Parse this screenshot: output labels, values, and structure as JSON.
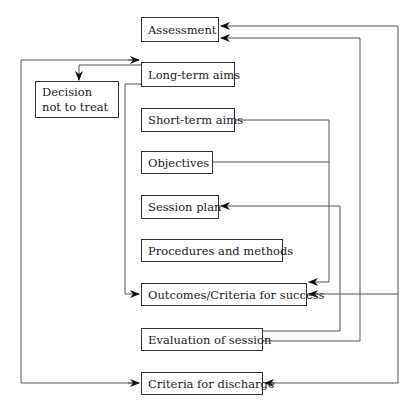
{
  "diagram": {
    "nodes": {
      "assessment": "Assessment",
      "long_term_aims": "Long-term aims",
      "decision_not_to_treat": "Decision not to treat",
      "short_term_aims": "Short-term aims",
      "objectives": "Objectives",
      "session_plan": "Session plan",
      "procedures_and_methods": "Procedures and methods",
      "outcomes": "Outcomes/Criteria for success",
      "evaluation_of_session": "Evaluation of session",
      "criteria_for_discharge": "Criteria for discharge"
    },
    "edges": [
      {
        "from": "Long-term aims",
        "to": "Decision not to treat"
      },
      {
        "from": "Long-term aims",
        "to": "Outcomes/Criteria for success"
      },
      {
        "from": "Short-term aims",
        "to": "Outcomes/Criteria for success"
      },
      {
        "from": "Objectives",
        "to": "Outcomes/Criteria for success"
      },
      {
        "from": "Evaluation of session",
        "to": "Session plan"
      },
      {
        "from": "Evaluation of session",
        "to": "Assessment"
      },
      {
        "from": "Assessment",
        "to": "Outcomes/Criteria for success"
      },
      {
        "from": "Assessment",
        "to": "Criteria for discharge"
      },
      {
        "from": "Criteria for discharge",
        "to": "Long-term aims"
      }
    ],
    "colors": {
      "line": "#555555",
      "border": "#333333",
      "text": "#222222"
    }
  }
}
